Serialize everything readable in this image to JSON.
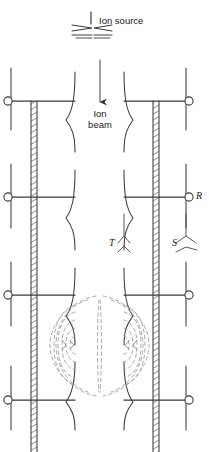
{
  "figure": {
    "type": "schematic-diagram",
    "background_color": "#ffffff",
    "line_color": "#3a3a3a",
    "dashed_color": "#9a9a9a",
    "hatch_color": "#6e6e6e"
  },
  "labels": {
    "ion_source": "Ion source",
    "ion_beam_line1": "Ion",
    "ion_beam_line2": "beam",
    "electrode_r": "R",
    "electrode_t": "T",
    "electrode_s": "S"
  },
  "icons": {
    "ion_source_symbol": "ion-source-icon",
    "beam_arrow": "down-arrow-icon",
    "terminal": "circle-terminal-icon",
    "hatched_column": "hatched-electrode-icon",
    "field_lines": "dashed-field-line-icon"
  },
  "geometry": {
    "canvas": {
      "width": 209,
      "height": 452
    },
    "terminals": [
      {
        "name": "left-top",
        "cx": 8,
        "cy": 101
      },
      {
        "name": "right-top",
        "cx": 189,
        "cy": 101
      },
      {
        "name": "left-mid",
        "cx": 8,
        "cy": 197
      },
      {
        "name": "right-mid",
        "cx": 189,
        "cy": 197
      },
      {
        "name": "left-low",
        "cx": 8,
        "cy": 295
      },
      {
        "name": "right-low",
        "cx": 189,
        "cy": 295
      },
      {
        "name": "left-bottom",
        "cx": 8,
        "cy": 400
      },
      {
        "name": "right-bottom",
        "cx": 189,
        "cy": 400
      }
    ],
    "crossbar_rows": [
      101,
      197,
      295,
      400
    ],
    "hatched_columns": [
      {
        "name": "left-electrode",
        "x": 31,
        "width": 6,
        "y1": 101,
        "y2": 452
      },
      {
        "name": "right-electrode",
        "x": 153,
        "width": 6,
        "y1": 101,
        "y2": 452
      }
    ]
  }
}
